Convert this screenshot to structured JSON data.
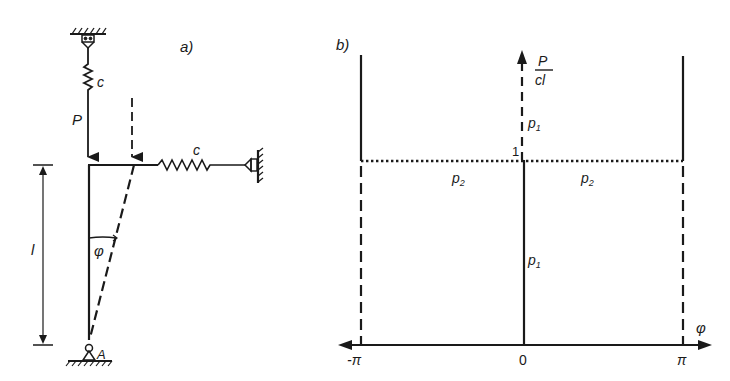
{
  "figure": {
    "panel_a": {
      "label": "a)",
      "spring_top_label": "c",
      "spring_right_label": "c",
      "load_label": "P",
      "length_label": "l",
      "angle_label": "φ",
      "pivot_label": "A"
    },
    "panel_b": {
      "label": "b)",
      "y_axis_label_num": "P",
      "y_axis_label_den": "cl",
      "x_axis_label": "φ",
      "level_label": "1",
      "x_ticks": [
        "-π",
        "0",
        "π"
      ],
      "branch_labels": {
        "p1_upper": "p",
        "p1_upper_sub": "1",
        "p1_lower": "p",
        "p1_lower_sub": "1",
        "p2_left": "p",
        "p2_left_sub": "2",
        "p2_right": "p",
        "p2_right_sub": "2"
      }
    },
    "colors": {
      "ink": "#1a1a1a",
      "background": "#ffffff"
    }
  }
}
